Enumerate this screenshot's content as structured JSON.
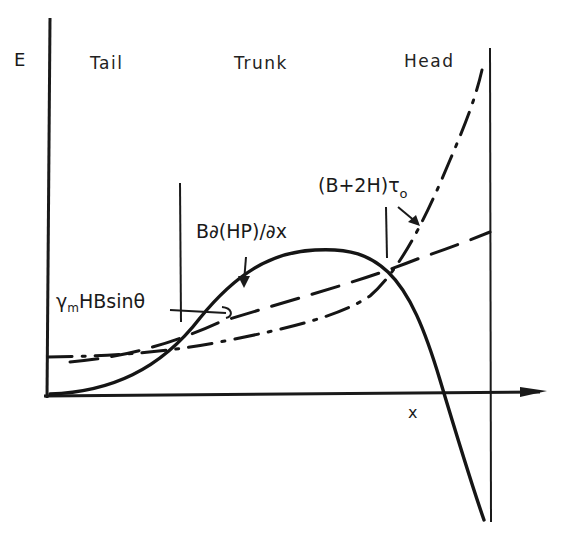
{
  "diagram": {
    "axes": {
      "y_label": "E",
      "x_label": "x"
    },
    "regions": [
      {
        "name": "tail",
        "label": "Tail"
      },
      {
        "name": "trunk",
        "label": "Trunk"
      },
      {
        "name": "head",
        "label": "Head"
      }
    ],
    "curves": [
      {
        "name": "pressure-gradient-term",
        "style": "solid",
        "label": "B∂(HP)/∂x"
      },
      {
        "name": "gravity-term",
        "style": "dashed",
        "label_main": "γ",
        "label_sub": "m",
        "label_rest": "HBsinθ"
      },
      {
        "name": "friction-term",
        "style": "dash-dot",
        "label_main": "(B+2H)τ",
        "label_sub": "o"
      }
    ]
  }
}
